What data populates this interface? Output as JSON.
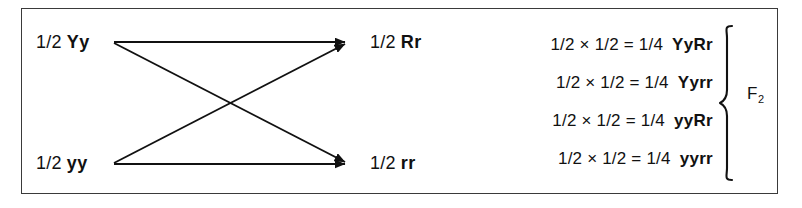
{
  "figure": {
    "type": "genetics-forked-line-diagram",
    "frame_border_color": "#3a3a3a",
    "ink_color": "#111111",
    "background_color": "#ffffff"
  },
  "cross": {
    "parents": [
      {
        "probability": "1/2",
        "genotype": "Yy"
      },
      {
        "probability": "1/2",
        "genotype": "yy"
      }
    ],
    "offspring": [
      {
        "probability": "1/2",
        "genotype": "Rr"
      },
      {
        "probability": "1/2",
        "genotype": "rr"
      }
    ],
    "arrows": [
      {
        "from": "Yy",
        "to": "Rr"
      },
      {
        "from": "Yy",
        "to": "rr"
      },
      {
        "from": "yy",
        "to": "Rr"
      },
      {
        "from": "yy",
        "to": "rr"
      }
    ]
  },
  "products": {
    "rows": [
      {
        "expression": "1/2 × 1/2 = 1/4",
        "genotype": "YyRr"
      },
      {
        "expression": "1/2 × 1/2 = 1/4",
        "genotype": "Yyrr"
      },
      {
        "expression": "1/2 × 1/2 = 1/4",
        "genotype": "yyRr"
      },
      {
        "expression": "1/2 × 1/2 = 1/4",
        "genotype": "yyrr"
      }
    ],
    "brace_label": "F",
    "brace_label_sub": "2"
  }
}
